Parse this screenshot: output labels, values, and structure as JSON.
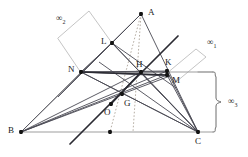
{
  "figure": {
    "type": "geometry-diagram",
    "canvas": {
      "width": 248,
      "height": 157,
      "background": "#ffffff"
    },
    "colors": {
      "dark_line": "#3c3c46",
      "heavy_line": "#2b2b33",
      "gray_line": "#9a9a9a",
      "light_gray_line": "#b9b9b9",
      "dotted_line": "#b0a9a0",
      "point_fill": "#141414",
      "label_color": "#1a1a1a"
    },
    "points": [
      {
        "name": "A",
        "x": 141,
        "y": 14,
        "label": "A",
        "label_x": 148,
        "label_y": 8,
        "marked": true
      },
      {
        "name": "B",
        "x": 21,
        "y": 132,
        "label": "B",
        "label_x": 8,
        "label_y": 126,
        "marked": true
      },
      {
        "name": "C",
        "x": 198,
        "y": 132,
        "label": "C",
        "label_x": 195,
        "label_y": 137,
        "marked": true
      },
      {
        "name": "L",
        "x": 112,
        "y": 43,
        "label": "L",
        "label_x": 101,
        "label_y": 37,
        "marked": true
      },
      {
        "name": "N",
        "x": 81,
        "y": 72,
        "label": "N",
        "label_x": 68,
        "label_y": 65,
        "marked": true
      },
      {
        "name": "H",
        "x": 141,
        "y": 72,
        "label": "H",
        "label_x": 136,
        "label_y": 60,
        "marked": true
      },
      {
        "name": "K",
        "x": 167,
        "y": 71,
        "label": "K",
        "label_x": 165,
        "label_y": 58,
        "marked": true
      },
      {
        "name": "M",
        "x": 167,
        "y": 75,
        "label": "M",
        "label_x": 172,
        "label_y": 76,
        "marked": true
      },
      {
        "name": "G",
        "x": 122,
        "y": 94,
        "label": "G",
        "label_x": 124,
        "label_y": 99,
        "marked": true
      },
      {
        "name": "O",
        "x": 111,
        "y": 104,
        "label": "O",
        "label_x": 104,
        "label_y": 108,
        "marked": true
      },
      {
        "name": "Pbc",
        "x": 110,
        "y": 132,
        "label": "",
        "label_x": 0,
        "label_y": 0,
        "marked": true
      }
    ],
    "infinity_labels": [
      {
        "name": "infinity-2",
        "text": "∞",
        "sub": "2",
        "x": 56,
        "y": 14
      },
      {
        "name": "infinity-1",
        "text": "∞",
        "sub": "1",
        "x": 207,
        "y": 38
      },
      {
        "name": "infinity-3",
        "text": "∞",
        "sub": "3",
        "x": 228,
        "y": 97
      }
    ],
    "annotations": {
      "brace_right": {
        "name": "brace-infinity-3",
        "x": 218,
        "top": 72,
        "bottom": 132
      },
      "parallelogram_2": {
        "name": "parallelogram-infinity-2",
        "points": "58,38 89,11 112,43 81,72"
      },
      "parallelogram_1": {
        "name": "parallelogram-infinity-1",
        "points": "166,74 196,49 206,57 176,82"
      }
    }
  }
}
